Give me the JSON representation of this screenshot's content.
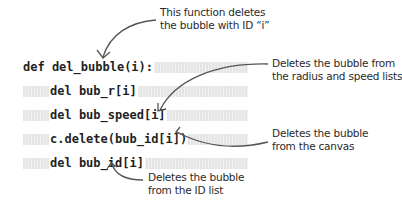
{
  "code": {
    "lines": [
      "def del_bubble(i):",
      "del bub_r[i]",
      "del bub_speed[i]",
      "c.delete(bub_id[i])",
      "del bub_id[i]"
    ]
  },
  "annotations": [
    {
      "lines": [
        "This function deletes",
        "the bubble with ID “i”"
      ],
      "target": "def del_bubble(i):"
    },
    {
      "lines": [
        "Deletes the bubble from",
        "the radius and speed lists"
      ],
      "target": "del bub_speed[i]"
    },
    {
      "lines": [
        "Deletes the bubble",
        "from the canvas"
      ],
      "target": "c.delete(bub_id[i])"
    },
    {
      "lines": [
        "Deletes the bubble",
        "from the ID list"
      ],
      "target": "del bub_id[i]"
    }
  ],
  "colors": {
    "code_text": "#1f1f1f",
    "annotation_text": "#2a2a2a",
    "arrow": "#555555",
    "band": "#e4e4e4"
  }
}
